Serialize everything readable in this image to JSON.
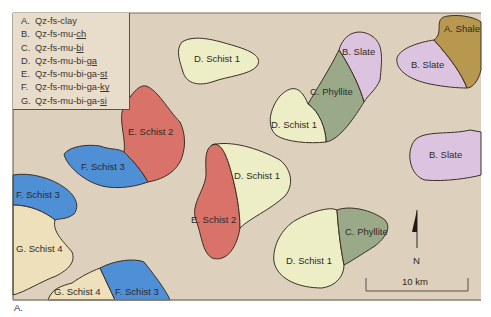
{
  "figure": {
    "caption": "A.",
    "background_color": "#ddd0bd"
  },
  "legend": {
    "items": [
      {
        "key": "A.",
        "base": "Qz-fs-",
        "emph": "clay",
        "underline": false
      },
      {
        "key": "B.",
        "base": "Qz-fs-mu-",
        "emph": "ch",
        "underline": true
      },
      {
        "key": "C.",
        "base": "Qz-fs-mu-",
        "emph": "bi",
        "underline": true
      },
      {
        "key": "D.",
        "base": "Qz-fs-mu-bi-",
        "emph": "ga",
        "underline": true
      },
      {
        "key": "E.",
        "base": "Qz-fs-mu-bi-ga-",
        "emph": "st",
        "underline": true
      },
      {
        "key": "F.",
        "base": "Qz-fs-mu-bi-ga-",
        "emph": "ky",
        "underline": true
      },
      {
        "key": "G.",
        "base": "Qz-fs-mu-bi-ga-",
        "emph": "si",
        "underline": true
      }
    ]
  },
  "units": {
    "shale": {
      "label": "A. Shale",
      "color": "#b8984e"
    },
    "slate": {
      "label": "B. Slate",
      "color": "#dcc4e0"
    },
    "phyllite": {
      "label": "C. Phyllite",
      "color": "#9aaa88"
    },
    "schist1": {
      "label": "D. Schist 1",
      "color": "#eeeec6"
    },
    "schist2": {
      "label": "E. Schist 2",
      "color": "#d9736a"
    },
    "schist3": {
      "label": "F. Schist 3",
      "color": "#4f8fd6"
    },
    "schist4": {
      "label": "G. Schist 4",
      "color": "#efe0bc"
    }
  },
  "map_labels": {
    "shale_ne": "A. Shale",
    "slate_ne": "B. Slate",
    "slate_center_top": "B. Slate",
    "slate_east": "B. Slate",
    "phyllite_center": "C. Phyllite",
    "phyllite_se": "C. Phyllite",
    "schist1_top": "D. Schist 1",
    "schist1_center_top": "D. Schist 1",
    "schist1_middle": "D. Schist 1",
    "schist1_south": "D. Schist 1",
    "schist2_west": "E. Schist 2",
    "schist2_middle": "E. Schist 2",
    "schist3_west": "F. Schist 3",
    "schist3_far_west": "F. Schist 3",
    "schist3_south": "F. Schist 3",
    "schist4_west": "G. Schist 4",
    "schist4_south": "G. Schist 4"
  },
  "north_arrow": {
    "label": "N"
  },
  "scale_bar": {
    "label": "10 km"
  }
}
